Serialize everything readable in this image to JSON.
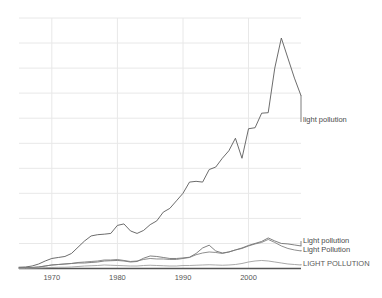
{
  "chart_data": {
    "type": "line",
    "title": "",
    "subtitle": "",
    "xlabel": "",
    "ylabel": "",
    "grid": true,
    "legend_position": "inline-right",
    "xlim": [
      1965,
      2008
    ],
    "ylim": [
      0,
      1.0
    ],
    "xticks": [
      "1970",
      "1980",
      "1990",
      "2000"
    ],
    "xtick_values": [
      1970,
      1980,
      1990,
      2000
    ],
    "yticks": [],
    "x": [
      1965,
      1966,
      1967,
      1968,
      1969,
      1970,
      1971,
      1972,
      1973,
      1974,
      1975,
      1976,
      1977,
      1978,
      1979,
      1980,
      1981,
      1982,
      1983,
      1984,
      1985,
      1986,
      1987,
      1988,
      1989,
      1990,
      1991,
      1992,
      1993,
      1994,
      1995,
      1996,
      1997,
      1998,
      1999,
      2000,
      2001,
      2002,
      2003,
      2004,
      2005,
      2006,
      2007,
      2008
    ],
    "series": [
      {
        "name": "light pollution",
        "label": "light pollution",
        "color": "#5b5b5b",
        "values": [
          0.005,
          0.006,
          0.01,
          0.018,
          0.03,
          0.04,
          0.044,
          0.048,
          0.06,
          0.085,
          0.11,
          0.13,
          0.135,
          0.137,
          0.14,
          0.172,
          0.178,
          0.15,
          0.14,
          0.152,
          0.175,
          0.19,
          0.225,
          0.24,
          0.27,
          0.3,
          0.345,
          0.348,
          0.345,
          0.395,
          0.405,
          0.44,
          0.47,
          0.52,
          0.44,
          0.558,
          0.562,
          0.62,
          0.622,
          0.8,
          0.92,
          0.84,
          0.76,
          0.69
        ]
      },
      {
        "name": "Light pollution",
        "label": "Light pollution",
        "color": "#6a6a6a",
        "values": [
          0.002,
          0.003,
          0.004,
          0.006,
          0.01,
          0.014,
          0.016,
          0.018,
          0.02,
          0.022,
          0.022,
          0.024,
          0.026,
          0.03,
          0.031,
          0.032,
          0.03,
          0.026,
          0.028,
          0.041,
          0.05,
          0.048,
          0.044,
          0.04,
          0.04,
          0.042,
          0.045,
          0.06,
          0.082,
          0.093,
          0.07,
          0.062,
          0.066,
          0.074,
          0.082,
          0.092,
          0.1,
          0.108,
          0.122,
          0.11,
          0.1,
          0.098,
          0.094,
          0.09
        ]
      },
      {
        "name": "Light Pollution",
        "label": "Light Pollution",
        "color": "#7a7a7a",
        "values": [
          0.002,
          0.003,
          0.004,
          0.006,
          0.01,
          0.014,
          0.016,
          0.018,
          0.02,
          0.024,
          0.026,
          0.028,
          0.03,
          0.034,
          0.034,
          0.036,
          0.032,
          0.028,
          0.03,
          0.036,
          0.04,
          0.038,
          0.038,
          0.036,
          0.036,
          0.04,
          0.044,
          0.055,
          0.062,
          0.066,
          0.064,
          0.06,
          0.066,
          0.074,
          0.08,
          0.09,
          0.098,
          0.104,
          0.116,
          0.104,
          0.09,
          0.08,
          0.074,
          0.07
        ]
      },
      {
        "name": "LIGHT POLLUTION",
        "label": "LIGHT POLLUTION",
        "color": "#9a9a9a",
        "values": [
          0.0,
          0.0,
          0.001,
          0.002,
          0.003,
          0.004,
          0.005,
          0.005,
          0.006,
          0.008,
          0.01,
          0.011,
          0.012,
          0.014,
          0.013,
          0.012,
          0.011,
          0.01,
          0.01,
          0.012,
          0.013,
          0.012,
          0.011,
          0.01,
          0.01,
          0.012,
          0.012,
          0.013,
          0.014,
          0.015,
          0.014,
          0.013,
          0.014,
          0.016,
          0.02,
          0.026,
          0.03,
          0.032,
          0.03,
          0.026,
          0.022,
          0.018,
          0.016,
          0.014
        ]
      }
    ],
    "annotations": [
      {
        "text": "light pollution",
        "x": 2008,
        "y": 0.69
      }
    ],
    "colors": {
      "grid": "#e8e8e8",
      "axis": "#555555",
      "background": "#ffffff",
      "tick_text": "#555555"
    }
  },
  "labels": {
    "inline_top": "light pollution",
    "legend_1": "Light pollution",
    "legend_2": "Light Pollution",
    "legend_3": "LIGHT POLLUTION"
  },
  "axis": {
    "tick_1970": "1970",
    "tick_1980": "1980",
    "tick_1990": "1990",
    "tick_2000": "2000"
  }
}
